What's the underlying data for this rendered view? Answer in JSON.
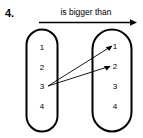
{
  "figure": {
    "question_number": "4.",
    "relation_label": "is bigger than",
    "left_set": {
      "name": "domain-set",
      "elements": [
        "1",
        "2",
        "3",
        "4"
      ]
    },
    "right_set": {
      "name": "codomain-set",
      "elements": [
        "1",
        "2",
        "3",
        "4"
      ]
    },
    "mappings": [
      {
        "from": "3",
        "to": "1"
      },
      {
        "from": "3",
        "to": "2"
      }
    ],
    "colors": {
      "ink": "#000000",
      "background": "#ffffff"
    }
  }
}
